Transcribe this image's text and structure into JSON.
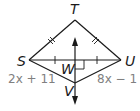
{
  "figure": {
    "points": {
      "T": {
        "label": "T",
        "x": 75,
        "y": 20
      },
      "S": {
        "label": "S",
        "x": 29,
        "y": 60
      },
      "U": {
        "label": "U",
        "x": 121,
        "y": 60
      },
      "W": {
        "label": "W",
        "x": 75,
        "y": 60
      },
      "V": {
        "label": "V",
        "x": 75,
        "y": 83
      }
    },
    "expressions": {
      "SV": "2x + 11",
      "VU": "8x − 1"
    },
    "colors": {
      "stroke": "#1a1a1a",
      "expression_text": "#808080"
    }
  }
}
